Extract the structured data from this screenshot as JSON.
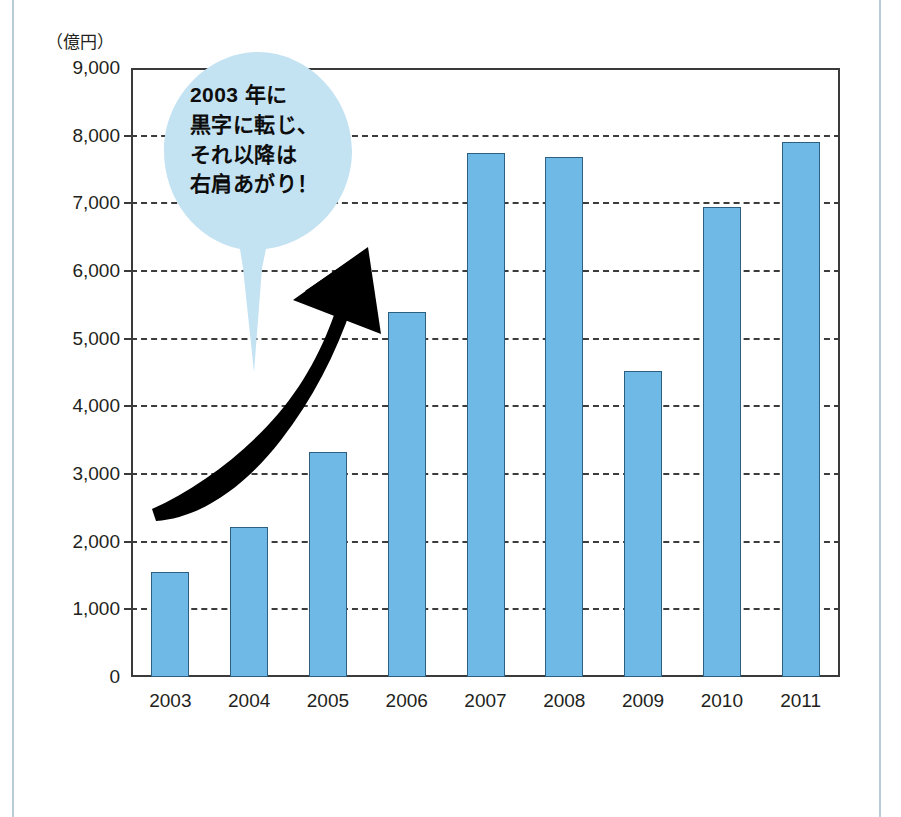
{
  "chart_data": {
    "type": "bar",
    "title": "",
    "subtitle": "",
    "xlabel": "",
    "ylabel": "（億円）",
    "unit_label": "（億円）",
    "categories": [
      "2003",
      "2004",
      "2005",
      "2006",
      "2007",
      "2008",
      "2009",
      "2010",
      "2011"
    ],
    "values": [
      1550,
      2220,
      3320,
      5400,
      7750,
      7680,
      4520,
      6950,
      7900
    ],
    "ylim": [
      0,
      9000
    ],
    "ytick_labels": [
      "0",
      "1,000",
      "2,000",
      "3,000",
      "4,000",
      "5,000",
      "6,000",
      "7,000",
      "8,000",
      "9,000"
    ],
    "ytick_values": [
      0,
      1000,
      2000,
      3000,
      4000,
      5000,
      6000,
      7000,
      8000,
      9000
    ],
    "grid": "horizontal-dashed",
    "legend": "none",
    "bar_color": "#6fb9e6",
    "bar_border_color": "#2d5f80",
    "annotations": [
      {
        "type": "speech-bubble",
        "lines": [
          "2003 年に",
          "黒字に転じ、",
          "それ以降は",
          "右肩あがり！"
        ],
        "fill_color": "#c3e2f2",
        "text_color": "#0d0d0d"
      },
      {
        "type": "upward-trend-arrow",
        "color": "#000000"
      }
    ]
  },
  "annotation": {
    "bubble": {
      "line1": "2003 年に",
      "line2": "黒字に転じ、",
      "line3": "それ以降は",
      "line4": "右肩あがり！"
    }
  },
  "axis": {
    "unit": "（億円）"
  },
  "colors": {
    "bar_fill": "#6fb9e6",
    "bar_stroke": "#2d5f80",
    "bubble_fill": "#c3e2f2",
    "arrow": "#000000",
    "grid": "#3c3c3c",
    "frame": "#3a3a3a",
    "page_rule": "#b9cdd8",
    "text": "#231f20"
  }
}
